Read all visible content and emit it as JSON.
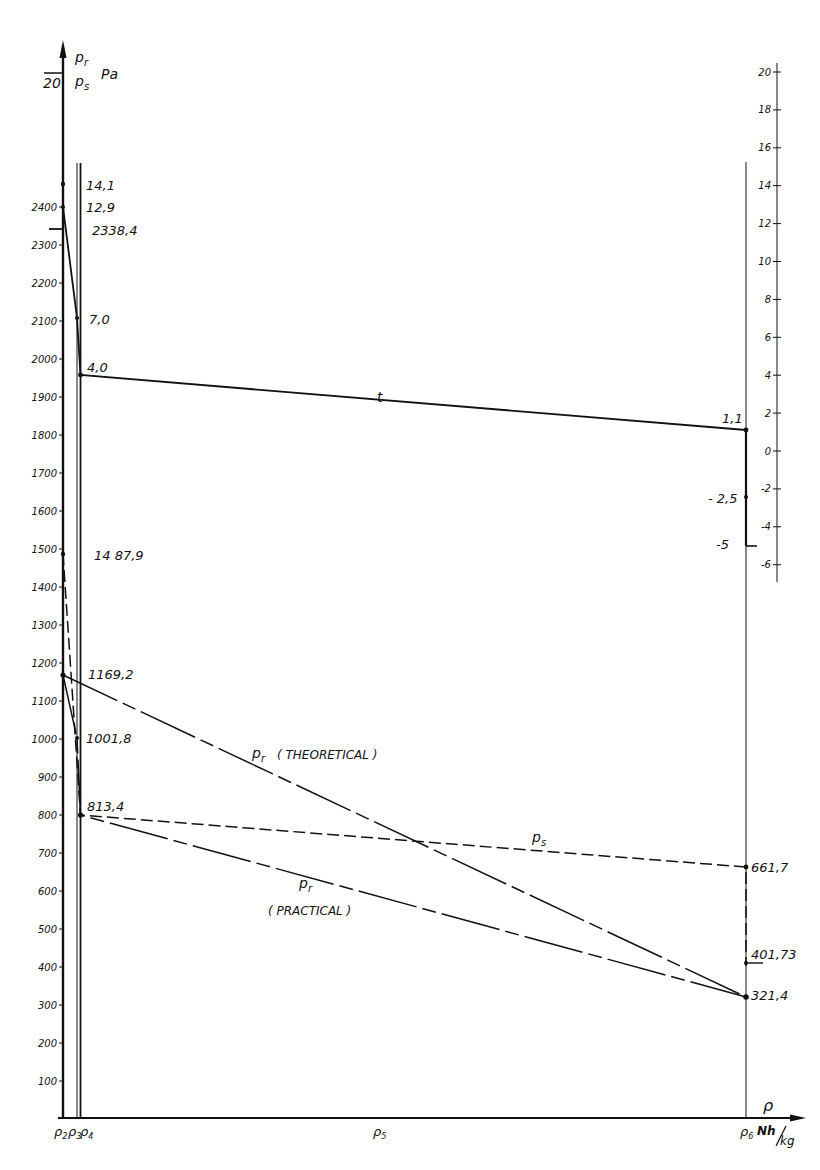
{
  "chart_data": {
    "type": "line",
    "title": "",
    "left_axis": {
      "label_top": "p_r",
      "label_bottom": "p_s",
      "unit": "Pa",
      "extra_mark": "20",
      "ticks": [
        100,
        200,
        300,
        400,
        500,
        600,
        700,
        800,
        900,
        1000,
        1100,
        1200,
        1300,
        1400,
        1500,
        1600,
        1700,
        1800,
        1900,
        2000,
        2100,
        2200,
        2300,
        2400
      ],
      "ylim": [
        0,
        2500
      ]
    },
    "right_axis": {
      "label": "t",
      "ticks": [
        20,
        18,
        16,
        14,
        12,
        10,
        8,
        6,
        4,
        2,
        0,
        -2,
        -4,
        -6
      ],
      "ylim": [
        -6.5,
        20.5
      ]
    },
    "x_axis": {
      "label": "ρ",
      "unit": "Nh/kg",
      "tick_labels": [
        "ρ2",
        "ρ3",
        "ρ4",
        "ρ5",
        "ρ6"
      ]
    },
    "series": [
      {
        "name": "t",
        "axis": "right",
        "style": "solid",
        "points": [
          {
            "x": "ρ2",
            "y": 14.1
          },
          {
            "x": "ρ2",
            "y": 12.9
          },
          {
            "x": "ρ3",
            "y": 7.0
          },
          {
            "x": "ρ4",
            "y": 4.0
          },
          {
            "x": "ρ6",
            "y": 1.1
          },
          {
            "x": "ρ6",
            "y": -2.5
          },
          {
            "x": "ρ6",
            "y": -5
          }
        ]
      },
      {
        "name": "p_s",
        "axis": "left",
        "style": "dashed",
        "points": [
          {
            "x": "ρ2",
            "y": 2338.4
          },
          {
            "x": "ρ2",
            "y": 1487.9
          },
          {
            "x": "ρ4",
            "y": 813.4
          },
          {
            "x": "ρ6",
            "y": 661.7
          },
          {
            "x": "ρ6",
            "y": 401.73
          }
        ]
      },
      {
        "name": "p_r (THEORETICAL)",
        "axis": "left",
        "style": "dash-dot",
        "points": [
          {
            "x": "ρ2",
            "y": 1169.2
          },
          {
            "x": "ρ6",
            "y": 321.4
          }
        ]
      },
      {
        "name": "p_r (PRACTICAL)",
        "axis": "left",
        "style": "dash-dot",
        "points": [
          {
            "x": "ρ2",
            "y": 1169.2
          },
          {
            "x": "ρ3",
            "y": 1001.8
          },
          {
            "x": "ρ4",
            "y": 813.4
          },
          {
            "x": "ρ6",
            "y": 321.4
          }
        ]
      }
    ],
    "annotations": [
      "14,1",
      "12,9",
      "2338,4",
      "7,0",
      "4,0",
      "1,1",
      "- 2,5",
      "-5",
      "1487,9",
      "1169,2",
      "1001,8",
      "813,4",
      "661,7",
      "401,73",
      "321,4",
      "p_r ( THEORETICAL )",
      "p_s",
      "p_r ( PRACTICAL )",
      "t"
    ],
    "grid": false
  },
  "labels": {
    "pr": "p",
    "pr_sub": "r",
    "ps": "p",
    "ps_sub": "s",
    "unit": "Pa",
    "twenty": "20",
    "t": "t",
    "theoretical": "( THEORETICAL )",
    "practical": "( PRACTICAL )",
    "rho": "ρ",
    "unit_x_num": "Nh",
    "unit_x_den": "kg",
    "rho2": "ρ",
    "rho2_sub": "2",
    "rho3": "ρ",
    "rho3_sub": "3",
    "rho4": "ρ",
    "rho4_sub": "4",
    "rho5": "ρ",
    "rho5_sub": "5",
    "rho6": "ρ",
    "rho6_sub": "6",
    "v14_1": "14,1",
    "v12_9": "12,9",
    "v2338_4": "2338,4",
    "v7_0": "7,0",
    "v4_0": "4,0",
    "v1_1": "1,1",
    "vm2_5": "- 2,5",
    "vm5": "-5",
    "v1487_9": "14 87,9",
    "v1169_2": "1169,2",
    "v1001_8": "1001,8",
    "v813_4": "813,4",
    "v661_7": "661,7",
    "v401_73": "401,73",
    "v321_4": "321,4"
  }
}
